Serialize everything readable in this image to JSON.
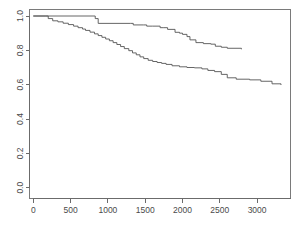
{
  "chart_data": {
    "type": "line",
    "title": "",
    "subtitle": "",
    "xlabel": "",
    "ylabel": "",
    "xlim": [
      0,
      3400
    ],
    "ylim": [
      0.0,
      1.0
    ],
    "grid": false,
    "legend": "none",
    "annotations": [],
    "x_ticks": [
      0,
      500,
      1000,
      1500,
      2000,
      2500,
      3000
    ],
    "x_tick_labels": [
      "0",
      "500",
      "1000",
      "1500",
      "2000",
      "2500",
      "3000"
    ],
    "y_ticks": [
      0.0,
      0.2,
      0.4,
      0.6,
      0.8,
      1.0
    ],
    "y_tick_labels": [
      "0.0",
      "0.2",
      "0.4",
      "0.6",
      "0.8",
      "1.0"
    ],
    "series": [
      {
        "name": "upper-curve",
        "step": "post",
        "color": "#555555",
        "x": [
          0,
          800,
          830,
          870,
          1300,
          1340,
          1480,
          1520,
          1600,
          1700,
          1750,
          1800,
          1900,
          1960,
          2000,
          2060,
          2100,
          2180,
          2280,
          2380,
          2440,
          2520,
          2600,
          2790
        ],
        "y": [
          1.0,
          1.0,
          0.985,
          0.957,
          0.957,
          0.948,
          0.948,
          0.941,
          0.941,
          0.932,
          0.932,
          0.922,
          0.905,
          0.9,
          0.893,
          0.88,
          0.861,
          0.845,
          0.839,
          0.836,
          0.824,
          0.818,
          0.812,
          0.806
        ]
      },
      {
        "name": "lower-curve",
        "step": "post",
        "color": "#555555",
        "x": [
          0,
          160,
          200,
          260,
          330,
          400,
          470,
          540,
          600,
          660,
          700,
          760,
          820,
          870,
          920,
          970,
          1020,
          1070,
          1120,
          1170,
          1220,
          1280,
          1330,
          1380,
          1430,
          1480,
          1540,
          1600,
          1660,
          1720,
          1780,
          1860,
          1960,
          2060,
          2160,
          2260,
          2340,
          2430,
          2520,
          2600,
          2720,
          2900,
          3050,
          3200,
          3320
        ],
        "y": [
          1.0,
          1.0,
          0.985,
          0.972,
          0.966,
          0.958,
          0.95,
          0.941,
          0.932,
          0.924,
          0.916,
          0.906,
          0.896,
          0.886,
          0.876,
          0.866,
          0.856,
          0.845,
          0.834,
          0.822,
          0.81,
          0.798,
          0.785,
          0.774,
          0.762,
          0.752,
          0.742,
          0.735,
          0.729,
          0.724,
          0.718,
          0.71,
          0.704,
          0.7,
          0.698,
          0.692,
          0.683,
          0.676,
          0.66,
          0.64,
          0.632,
          0.628,
          0.62,
          0.605,
          0.598
        ]
      }
    ]
  },
  "axes": {
    "x_axis_name": "x-axis",
    "y_axis_name": "y-axis"
  }
}
